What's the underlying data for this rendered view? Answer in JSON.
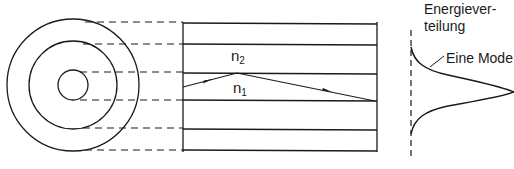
{
  "diagram": {
    "fiber_cross_section": {
      "circles": [
        {
          "name": "cladding-outer",
          "cx": 73,
          "cy": 85,
          "r": 66
        },
        {
          "name": "cladding-inner",
          "cx": 73,
          "cy": 85,
          "r": 44
        },
        {
          "name": "core",
          "cx": 73,
          "cy": 85,
          "r": 15
        }
      ]
    },
    "longitudinal_view": {
      "layer_lines_y": [
        22,
        44,
        72,
        100,
        129,
        150
      ],
      "x_start": 183,
      "x_end": 377
    },
    "labels": {
      "n2": {
        "base": "n",
        "sub": "2"
      },
      "n1": {
        "base": "n",
        "sub": "1"
      },
      "energy_title_line1": "Energiever-",
      "energy_title_line2": "teilung",
      "mode": "Eine Mode"
    },
    "ray_path": [
      [
        183,
        87
      ],
      [
        237,
        73
      ],
      [
        375,
        101
      ]
    ],
    "colors": {
      "line": "#1a1a1a",
      "background": "#ffffff"
    }
  }
}
